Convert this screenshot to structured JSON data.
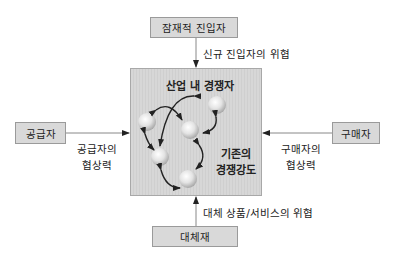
{
  "diagram": {
    "type": "five-forces",
    "top_box": {
      "label": "잠재적 진입자"
    },
    "top_arrow_label": "신규 진입자의 위협",
    "left_box": {
      "label": "공급자"
    },
    "left_arrow_label_line1": "공급자의",
    "left_arrow_label_line2": "협상력",
    "right_box": {
      "label": "구매자"
    },
    "right_arrow_label_line1": "구매자의",
    "right_arrow_label_line2": "협상력",
    "bottom_box": {
      "label": "대체재"
    },
    "bottom_arrow_label": "대체 상품/서비스의 위협",
    "center": {
      "title": "산업 내 경쟁자",
      "rivalry_line1": "기존의",
      "rivalry_line2": "경쟁강도",
      "sphere_count": 5
    },
    "colors": {
      "box_fill": "#d9d9d9",
      "box_border": "#9a9a9a",
      "arrow": "#222222",
      "connector_line": "#888888"
    }
  }
}
